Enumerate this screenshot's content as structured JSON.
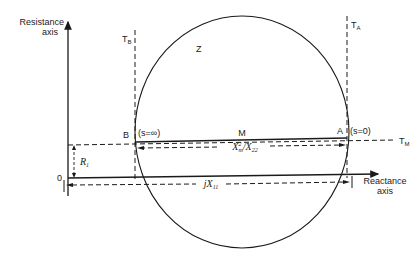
{
  "diagram": {
    "type": "circle-diagram",
    "axes": {
      "resistance_axis_label_line1": "Resistance",
      "resistance_axis_label_line2": "axis",
      "reactance_axis_label_line1": "Reactance",
      "reactance_axis_label_line2": "axis",
      "origin_label": "0"
    },
    "circle_label": "Z",
    "tangents": {
      "tb_main": "T",
      "tb_sub": "B",
      "ta_main": "T",
      "ta_sub": "A",
      "tm_main": "T",
      "tm_sub": "M"
    },
    "points": {
      "b_label": "B",
      "b_condition": "(s=∞)",
      "a_label": "A",
      "a_condition": "(s=0)",
      "m_label": "M"
    },
    "dimensions": {
      "chord_main": "X",
      "chord_sup": "2",
      "chord_sub": "m",
      "chord_tail": "/X",
      "chord_tail_sub": "22",
      "r1_main": "R",
      "r1_sub": "1",
      "jx11_main": "jX",
      "jx11_sub": "11"
    },
    "colors": {
      "ink": "#1a1a1a",
      "background": "#ffffff"
    }
  }
}
